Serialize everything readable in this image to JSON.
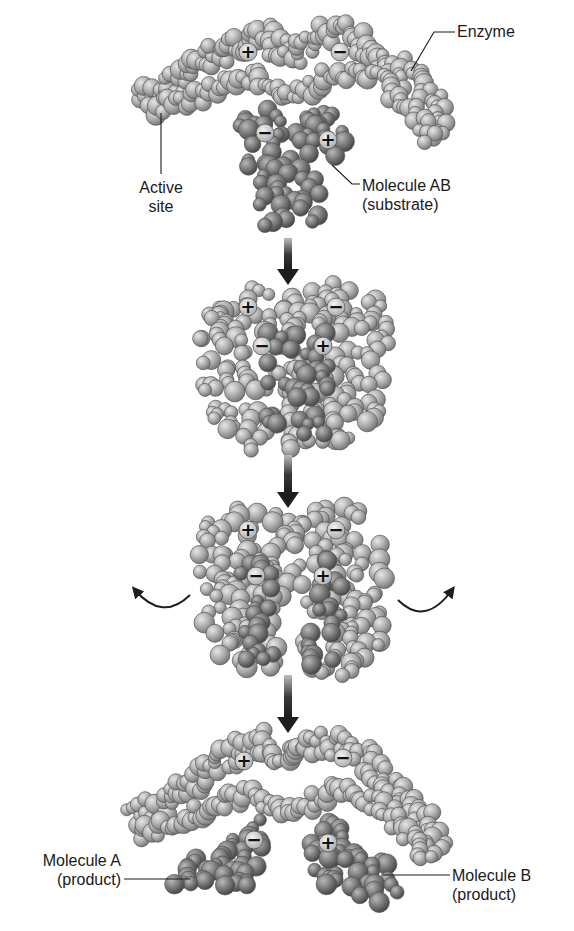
{
  "figure": {
    "colors": {
      "background": "#ffffff",
      "enzyme_light": "#d2d2d2",
      "enzyme_mid": "#a8a8a8",
      "enzyme_dark": "#7a7a7a",
      "substrate_light": "#a6a6a6",
      "substrate_mid": "#7b7b7b",
      "substrate_dark": "#4f4f4f",
      "outline": "#555555",
      "arrow": "#1e1e1e",
      "text": "#1a1a1a"
    }
  },
  "labels": {
    "enzyme": "Enzyme",
    "active_site_line1": "Active",
    "active_site_line2": "site",
    "substrate_line1": "Molecule AB",
    "substrate_line2": "(substrate)",
    "product_a_line1": "Molecule A",
    "product_a_line2": "(product)",
    "product_b_line1": "Molecule B",
    "product_b_line2": "(product)"
  },
  "charges": {
    "plus": "+",
    "minus": "−"
  },
  "stages": [
    {
      "name": "step-1-enzyme-and-substrate-separate",
      "y": 20
    },
    {
      "name": "step-2-substrate-bound-in-active-site",
      "y": 275
    },
    {
      "name": "step-3-enzyme-strains-bond",
      "y": 505
    },
    {
      "name": "step-4-products-released",
      "y": 730
    }
  ],
  "arrows": {
    "down": [
      {
        "x": 288,
        "y1": 238,
        "y2": 285
      },
      {
        "x": 288,
        "y1": 455,
        "y2": 508
      },
      {
        "x": 288,
        "y1": 675,
        "y2": 733
      }
    ],
    "curved": [
      {
        "side": "left",
        "x1": 190,
        "y1": 600,
        "x2": 135,
        "y2": 600
      },
      {
        "side": "right",
        "x1": 398,
        "y1": 605,
        "x2": 452,
        "y2": 600
      }
    ]
  }
}
